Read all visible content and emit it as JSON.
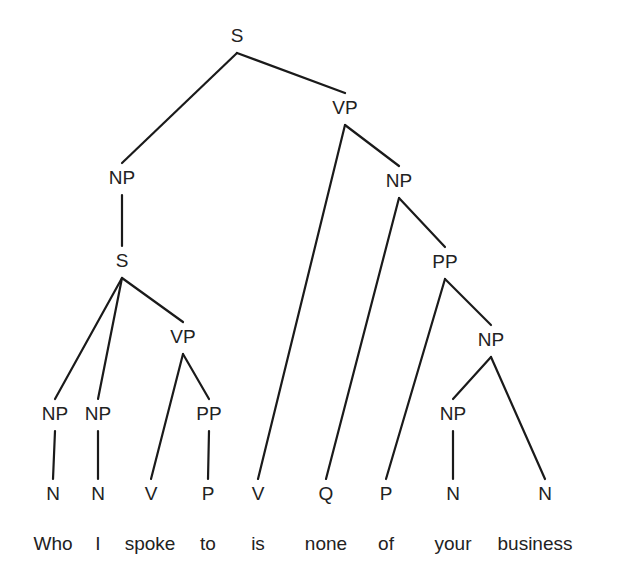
{
  "diagram": {
    "type": "syntax-tree",
    "sentence": [
      "Who",
      "I",
      "spoke",
      "to",
      "is",
      "none",
      "of",
      "your",
      "business"
    ],
    "nodes": [
      {
        "id": "s0",
        "label": "S"
      },
      {
        "id": "np1",
        "label": "NP"
      },
      {
        "id": "vp1",
        "label": "VP"
      },
      {
        "id": "s1",
        "label": "S"
      },
      {
        "id": "np2",
        "label": "NP"
      },
      {
        "id": "np3",
        "label": "NP"
      },
      {
        "id": "np4",
        "label": "NP"
      },
      {
        "id": "vp2",
        "label": "VP"
      },
      {
        "id": "pp1",
        "label": "PP"
      },
      {
        "id": "pp2",
        "label": "PP"
      },
      {
        "id": "np5",
        "label": "NP"
      },
      {
        "id": "np6",
        "label": "NP"
      },
      {
        "id": "t1",
        "label": "N"
      },
      {
        "id": "t2",
        "label": "N"
      },
      {
        "id": "t3",
        "label": "V"
      },
      {
        "id": "t4",
        "label": "P"
      },
      {
        "id": "t5",
        "label": "V"
      },
      {
        "id": "t6",
        "label": "Q"
      },
      {
        "id": "t7",
        "label": "P"
      },
      {
        "id": "t8",
        "label": "N"
      },
      {
        "id": "t9",
        "label": "N"
      }
    ],
    "edges": [
      [
        "s0",
        "np1"
      ],
      [
        "s0",
        "vp1"
      ],
      [
        "np1",
        "s1"
      ],
      [
        "s1",
        "np2"
      ],
      [
        "s1",
        "np3"
      ],
      [
        "s1",
        "vp2"
      ],
      [
        "np2",
        "t1"
      ],
      [
        "np3",
        "t2"
      ],
      [
        "vp2",
        "t3"
      ],
      [
        "vp2",
        "pp1"
      ],
      [
        "pp1",
        "t4"
      ],
      [
        "vp1",
        "t5"
      ],
      [
        "vp1",
        "np4"
      ],
      [
        "np4",
        "t6"
      ],
      [
        "np4",
        "pp2"
      ],
      [
        "pp2",
        "t7"
      ],
      [
        "pp2",
        "np5"
      ],
      [
        "np5",
        "np6"
      ],
      [
        "np5",
        "t9"
      ],
      [
        "np6",
        "t8"
      ]
    ]
  }
}
